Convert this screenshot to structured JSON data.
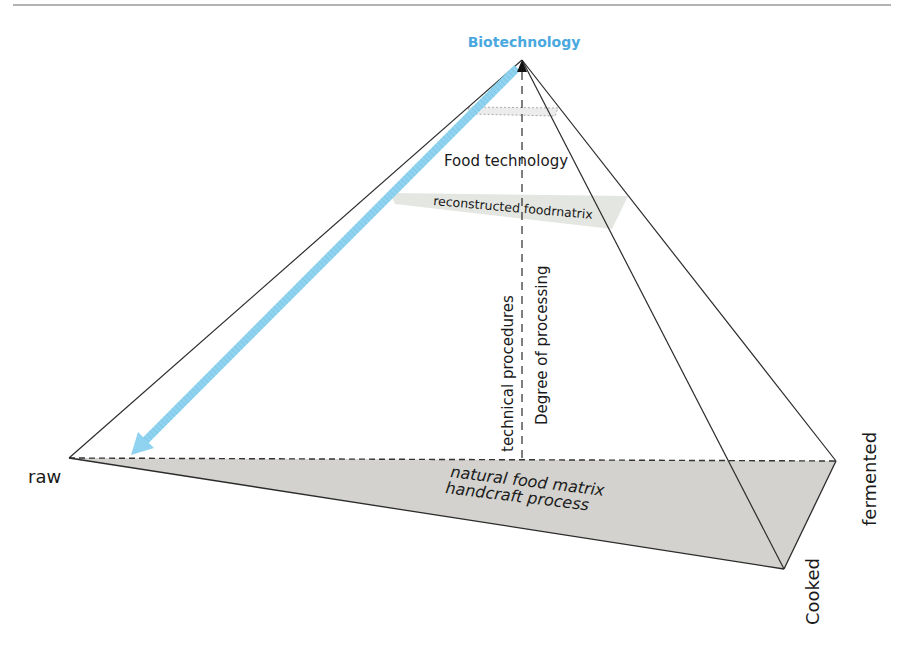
{
  "diagram": {
    "colors": {
      "apex_label": "#4aa8e0",
      "arrow": "#8fd3f0",
      "base_fill": "#d3d2ce",
      "band_fill": "#e4e6e2",
      "lines": "#2b2b2b"
    },
    "labels": {
      "apex": "Biotechnology",
      "food_technology": "Food technology",
      "reconstructed": "reconstructed foodrnatrix",
      "technical_procedures": "technical procedures",
      "degree_of_processing": "Degree of processing",
      "natural_food_matrix": "natural food matrix",
      "handcraft_process": "handcraft process",
      "raw": "raw",
      "fermented": "fermented",
      "cooked": "Cooked"
    }
  }
}
